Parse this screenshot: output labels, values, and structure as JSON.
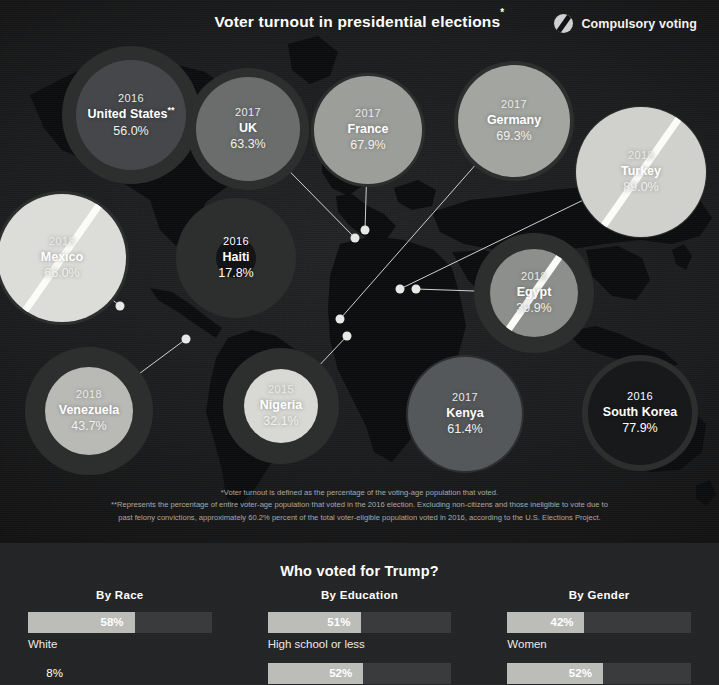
{
  "header": {
    "title": "Voter turnout in presidential elections",
    "title_sup": "*",
    "legend_label": "Compulsory voting",
    "legend_icon": "striped-circle-icon"
  },
  "colors": {
    "panel_bg": "#1c1d1e",
    "bottom_bg": "#232425",
    "bubble_halo": "#2d2f2f",
    "bar_track": "#3a3b3c",
    "bar_fill": "#bcbdb9",
    "text": "#ffffff",
    "footnote_text": "#a7a9a7",
    "connector": "#cfd1d0"
  },
  "chart_data": {
    "type": "bubble",
    "title": "Voter turnout in presidential elections",
    "ylabel": "Voter turnout (% of voting-age population)",
    "unit": "%",
    "legend": [
      {
        "label": "Compulsory voting",
        "marker": "striped-circle"
      }
    ],
    "countries": [
      {
        "name": "United States",
        "name_sup": "**",
        "year": "2016",
        "value": 56.0,
        "value_label": "56.0%",
        "compulsory": false,
        "cx": 131,
        "cy": 115,
        "halo_r": 69,
        "disc_r": 55,
        "disc_shade": "#45474a",
        "dark": false,
        "pin": null
      },
      {
        "name": "UK",
        "year": "2017",
        "value": 63.3,
        "value_label": "63.3%",
        "compulsory": false,
        "cx": 248,
        "cy": 129,
        "halo_r": 61,
        "disc_r": 52,
        "disc_shade": "#6a6d6c",
        "dark": false,
        "pin": {
          "x": 355,
          "y": 238
        }
      },
      {
        "name": "France",
        "year": "2017",
        "value": 67.9,
        "value_label": "67.9%",
        "compulsory": false,
        "cx": 368,
        "cy": 130,
        "halo_r": 57,
        "disc_r": 54,
        "disc_shade": "#9c9e9a",
        "dark": false,
        "pin": {
          "x": 365,
          "y": 230
        }
      },
      {
        "name": "Germany",
        "year": "2017",
        "value": 69.3,
        "value_label": "69.3%",
        "compulsory": false,
        "cx": 514,
        "cy": 121,
        "halo_r": 60,
        "disc_r": 56,
        "disc_shade": "#a3a5a1",
        "dark": false,
        "pin": {
          "x": 340,
          "y": 319
        }
      },
      {
        "name": "Turkey",
        "year": "2018",
        "value": 89.0,
        "value_label": "89.0%",
        "compulsory": true,
        "cx": 641,
        "cy": 172,
        "halo_r": 66,
        "disc_r": 65,
        "disc_shade": "#d0d1cd",
        "dark": false,
        "pin": {
          "x": 400,
          "y": 289
        }
      },
      {
        "name": "Mexico",
        "year": "2018",
        "value": 66.0,
        "value_label": "66.0%",
        "compulsory": true,
        "cx": 62,
        "cy": 258,
        "halo_r": 67,
        "disc_r": 64,
        "disc_shade": "#dcddd8",
        "dark": false,
        "pin": {
          "x": 120,
          "y": 306
        }
      },
      {
        "name": "Haiti",
        "year": "2016",
        "value": 17.8,
        "value_label": "17.8%",
        "compulsory": false,
        "cx": 236,
        "cy": 258,
        "halo_r": 60,
        "disc_r": 20,
        "disc_shade": "#141516",
        "dark": true,
        "pin": null
      },
      {
        "name": "Egypt",
        "year": "2018",
        "value": 39.9,
        "value_label": "39.9%",
        "compulsory": true,
        "cx": 534,
        "cy": 293,
        "halo_r": 60,
        "disc_r": 44,
        "disc_shade": "#8d8f8c",
        "dark": false,
        "pin": {
          "x": 416,
          "y": 289
        }
      },
      {
        "name": "Venezuela",
        "year": "2018",
        "value": 43.7,
        "value_label": "43.7%",
        "compulsory": false,
        "cx": 89,
        "cy": 411,
        "halo_r": 64,
        "disc_r": 44,
        "disc_shade": "#b9bab6",
        "dark": false,
        "pin": {
          "x": 186,
          "y": 339
        }
      },
      {
        "name": "Nigeria",
        "year": "2015",
        "value": 32.1,
        "value_label": "32.1%",
        "compulsory": false,
        "cx": 281,
        "cy": 406,
        "halo_r": 58,
        "disc_r": 37,
        "disc_shade": "#d8d9d4",
        "dark": false,
        "pin": {
          "x": 347,
          "y": 336
        }
      },
      {
        "name": "Kenya",
        "year": "2017",
        "value": 61.4,
        "value_label": "61.4%",
        "compulsory": false,
        "cx": 465,
        "cy": 414,
        "halo_r": 59,
        "disc_r": 57,
        "disc_shade": "#55585a",
        "dark": false,
        "pin": null
      },
      {
        "name": "South Korea",
        "year": "2016",
        "value": 77.9,
        "value_label": "77.9%",
        "compulsory": false,
        "cx": 640,
        "cy": 413,
        "halo_r": 58,
        "disc_r": 52,
        "disc_shade": "#18191a",
        "dark": true,
        "pin": null
      }
    ]
  },
  "footnotes": {
    "line1": "*Voter turnout is defined as the percentage of the voting-age population that voted.",
    "line2": "**Represents the percentage of entire voter-age population that voted in the 2016 election. Excluding non-citizens and those ineligible to vote due to",
    "line3": "past felony convictions, approximately 60.2% percent of the total voter-eligible population voted in 2016, according to the U.S. Elections Project."
  },
  "bottom": {
    "title": "Who voted for Trump?",
    "chart_data": {
      "type": "bar",
      "title": "Who voted for Trump?",
      "unit": "%",
      "xlim": [
        0,
        100
      ],
      "groups": [
        {
          "title": "By Race",
          "categories": [
            "White",
            "8%"
          ],
          "bars": [
            {
              "label": "White",
              "value": 58,
              "value_label": "58%"
            },
            {
              "label": "8%",
              "value": 8,
              "value_label": "8%",
              "hidden_track": true
            }
          ]
        },
        {
          "title": "By Education",
          "categories": [
            "High school or less",
            ""
          ],
          "bars": [
            {
              "label": "High school or less",
              "value": 51,
              "value_label": "51%"
            },
            {
              "label": "",
              "value": 52,
              "value_label": "52%"
            }
          ]
        },
        {
          "title": "By Gender",
          "categories": [
            "Women",
            ""
          ],
          "bars": [
            {
              "label": "Women",
              "value": 42,
              "value_label": "42%"
            },
            {
              "label": "",
              "value": 52,
              "value_label": "52%"
            }
          ]
        }
      ]
    }
  }
}
